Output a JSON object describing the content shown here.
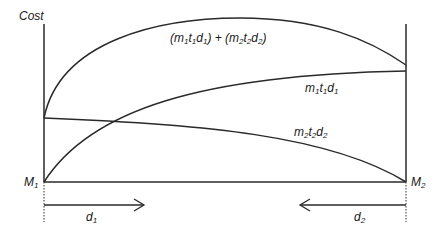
{
  "diagram": {
    "y_axis_label": "Cost",
    "markets": [
      {
        "id": "M1",
        "base": "M",
        "sub": "1"
      },
      {
        "id": "M2",
        "base": "M",
        "sub": "2"
      }
    ],
    "distances": [
      {
        "id": "d1",
        "base": "d",
        "sub": "1",
        "direction": "right"
      },
      {
        "id": "d2",
        "base": "d",
        "sub": "2",
        "direction": "left"
      }
    ],
    "curves": [
      {
        "id": "total",
        "label": "(m1t1d1) + (m2t2d2)"
      },
      {
        "id": "m1t1d1",
        "label": "m1t1d1"
      },
      {
        "id": "m2t2d2",
        "label": "m2t2d2"
      }
    ],
    "colors": {
      "line": "#2a2a2a",
      "background": "#ffffff"
    }
  }
}
